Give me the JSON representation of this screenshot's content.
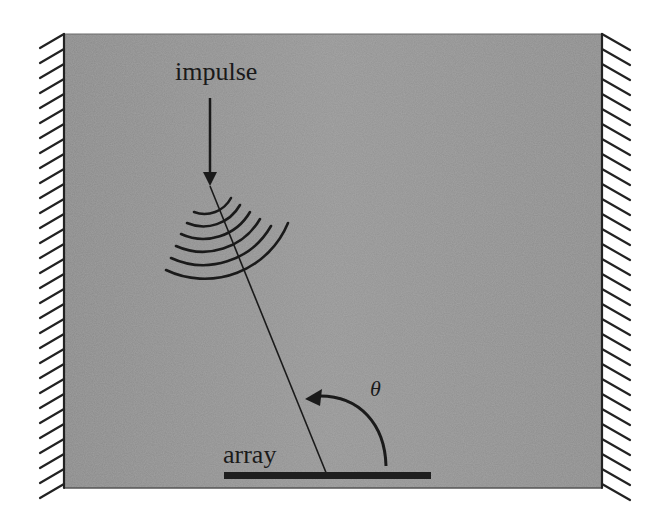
{
  "diagram": {
    "labels": {
      "impulse": "impulse",
      "array": "array",
      "angle": "θ"
    },
    "elements": {
      "medium": "gray rectangular domain",
      "walls": "hatched rigid walls on left and right",
      "impulse_arrow": "downward arrow to source point",
      "wavefronts": 6,
      "ray": "straight line from source to array",
      "array_bar": "horizontal sensor array at bottom",
      "angle_arc": "curved arrow indicating angle θ"
    },
    "colors": {
      "background": "#ffffff",
      "medium": "#8e8e8e",
      "ink": "#1a1a1a"
    }
  }
}
